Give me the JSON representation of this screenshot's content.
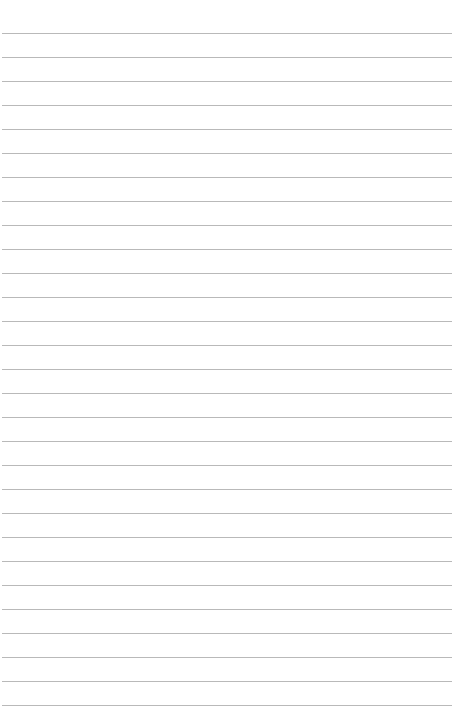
{
  "page": {
    "type": "lined-paper",
    "background_color": "#ffffff",
    "rule_color": "#b9b9b9",
    "rule_count": 29,
    "first_rule_y": 33,
    "rule_spacing": 24,
    "rule_left": 2,
    "rule_width": 450
  }
}
